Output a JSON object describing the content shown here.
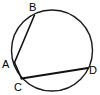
{
  "figure": {
    "background_color": "#ffffff",
    "stroke_color": "#111111",
    "circle": {
      "center_x": 52,
      "center_y": 50.5,
      "radius": 40.5,
      "stroke_width": 1.4
    },
    "points": [
      {
        "id": "A",
        "label": "A",
        "x": 14.5,
        "y": 62.5,
        "label_x": 2,
        "label_y": 68
      },
      {
        "id": "B",
        "label": "B",
        "x": 34.5,
        "y": 15.0,
        "label_x": 29,
        "label_y": 11
      },
      {
        "id": "C",
        "label": "C",
        "x": 21.5,
        "y": 78.5,
        "label_x": 14,
        "label_y": 91
      },
      {
        "id": "D",
        "label": "D",
        "x": 88.0,
        "y": 68.0,
        "label_x": 89,
        "label_y": 74
      }
    ],
    "segments": [
      {
        "id": "AB",
        "from": "A",
        "to": "B",
        "label": "chord A to B",
        "weight": "thin"
      },
      {
        "id": "AC",
        "from": "A",
        "to": "C",
        "label": "segment A to C",
        "weight": "thin"
      },
      {
        "id": "CD",
        "from": "C",
        "to": "D",
        "label": "chord C to D",
        "weight": "thick"
      }
    ]
  }
}
